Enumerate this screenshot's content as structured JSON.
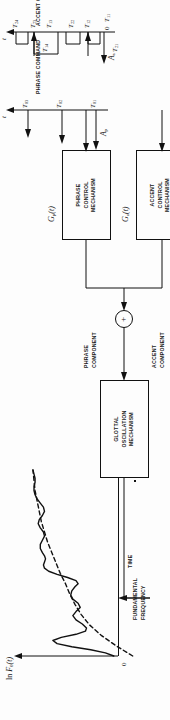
{
  "figure": {
    "line_color": "#111111",
    "background": "#fdfdfd"
  },
  "f0_plot": {
    "yaxis_label": "ln F0(t)",
    "yaxis_label_parts": {
      "prefix": "ln ",
      "symbol": "F",
      "subscript": "0",
      "arg": "(t)"
    },
    "xaxis_label": "t",
    "xaxis_name": "TIME",
    "origin_label": "0",
    "solid_curve_name": "f0-contour",
    "dashed_curve_name": "phrase-component-baseline",
    "curve_solid": [
      [
        0,
        4
      ],
      [
        3,
        12
      ],
      [
        6,
        26
      ],
      [
        9,
        44
      ],
      [
        12,
        58
      ],
      [
        15,
        62
      ],
      [
        18,
        54
      ],
      [
        21,
        40
      ],
      [
        24,
        31
      ],
      [
        27,
        30
      ],
      [
        31,
        34
      ],
      [
        35,
        40
      ],
      [
        39,
        43
      ],
      [
        43,
        40
      ],
      [
        47,
        36
      ],
      [
        51,
        38
      ],
      [
        55,
        43
      ],
      [
        59,
        45
      ],
      [
        63,
        44
      ],
      [
        67,
        41
      ],
      [
        70,
        38
      ],
      [
        73,
        40
      ],
      [
        76,
        48
      ],
      [
        79,
        58
      ],
      [
        82,
        66
      ],
      [
        85,
        70
      ],
      [
        88,
        71
      ],
      [
        91,
        70
      ],
      [
        94,
        69
      ],
      [
        97,
        70
      ],
      [
        100,
        72
      ],
      [
        104,
        74
      ],
      [
        108,
        74
      ],
      [
        112,
        72
      ],
      [
        116,
        70
      ],
      [
        120,
        71
      ],
      [
        124,
        74
      ],
      [
        128,
        76
      ],
      [
        132,
        75
      ],
      [
        136,
        72
      ],
      [
        140,
        70
      ],
      [
        144,
        71
      ],
      [
        148,
        74
      ],
      [
        152,
        77
      ],
      [
        156,
        79
      ],
      [
        160,
        80
      ],
      [
        164,
        80
      ],
      [
        168,
        79
      ],
      [
        172,
        79
      ],
      [
        176,
        80
      ],
      [
        180,
        81
      ]
    ],
    "curve_dashed": [
      [
        0,
        -14
      ],
      [
        10,
        2
      ],
      [
        20,
        16
      ],
      [
        30,
        27
      ],
      [
        40,
        35
      ],
      [
        50,
        41
      ],
      [
        60,
        46
      ],
      [
        70,
        50
      ],
      [
        80,
        55
      ],
      [
        90,
        59
      ],
      [
        100,
        63
      ],
      [
        110,
        67
      ],
      [
        120,
        70
      ],
      [
        130,
        73
      ],
      [
        140,
        75
      ],
      [
        150,
        77
      ],
      [
        160,
        79
      ],
      [
        170,
        80
      ],
      [
        180,
        81
      ]
    ]
  },
  "blocks": {
    "glottal": {
      "name": "glottal-oscillation-mechanism",
      "lines": [
        "GLOTTAL",
        "OSCILLATION",
        "MECHANISM"
      ]
    },
    "phrase_control": {
      "name": "phrase-control-mechanism",
      "lines": [
        "PHRASE",
        "CONTROL",
        "MECHANISM"
      ]
    },
    "accent_control": {
      "name": "accent-control-mechanism",
      "lines": [
        "ACCENT",
        "CONTROL",
        "MECHANISM"
      ]
    }
  },
  "signals": {
    "fundamental_frequency": "FUNDAMENTAL\nFREQUENCY",
    "fundamental_frequency_line1": "FUNDAMENTAL",
    "fundamental_frequency_line2": "FREQUENCY",
    "phrase_component_line1": "PHRASE",
    "phrase_component_line2": "COMPONENT",
    "accent_component_line1": "ACCENT",
    "accent_component_line2": "COMPONENT",
    "adder_symbol": "+"
  },
  "transfer_functions": {
    "phrase": {
      "symbol": "G",
      "subscript": "p",
      "arg": "(t)"
    },
    "accent": {
      "symbol": "G",
      "subscript": "a",
      "arg": "(t)"
    }
  },
  "phrase_command": {
    "title": "PHRASE COMMAND",
    "amplitude_symbol": "A",
    "amplitude_subscript": "p",
    "axis_label": "t",
    "impulses": [
      {
        "label_symbol": "T",
        "label_subscript": "01",
        "x": 8,
        "height": 30
      },
      {
        "label_symbol": "T",
        "label_subscript": "02",
        "x": 80,
        "height": 22
      },
      {
        "label_symbol": "T",
        "label_subscript": "03",
        "x": 150,
        "height": 16
      }
    ]
  },
  "accent_command": {
    "title": "ACCENT COMMAND",
    "amplitude_symbol": "A",
    "amplitude_subscript": "a",
    "axis_label": "t",
    "origin_label": "0",
    "steps": [
      {
        "on_symbol": "T",
        "on_subscript": "11",
        "off_symbol": "T",
        "off_subscript": "12",
        "x0": 10,
        "x1": 32,
        "height": 20
      },
      {
        "on_symbol": "T",
        "on_subscript": "21",
        "off_symbol": "T",
        "off_subscript": "22",
        "x0": 45,
        "x1": 66,
        "height": 16
      },
      {
        "on_symbol": "T",
        "on_subscript": "13",
        "off_symbol": "T",
        "off_subscript": "23",
        "x0": 80,
        "x1": 125,
        "height": 26
      },
      {
        "on_symbol": "T",
        "on_subscript": "14",
        "off_symbol": "T",
        "off_subscript": "24",
        "x0": 138,
        "x1": 158,
        "height": 18
      }
    ],
    "tick_labels": [
      "T11",
      "T12",
      "T21",
      "T22",
      "T13",
      "T23",
      "T14",
      "T24"
    ]
  }
}
